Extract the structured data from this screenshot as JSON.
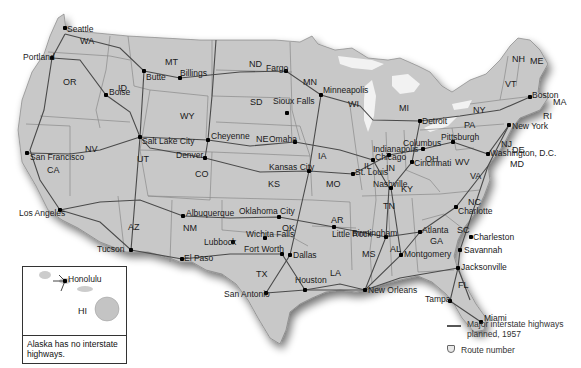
{
  "map": {
    "title": "Major interstate highways planned, 1957",
    "colors": {
      "land": "#c9c9c9",
      "state_border": "#8a8a8a",
      "highway": "#4a4a4a",
      "water": "#ffffff",
      "shadow": "#9a9a9a"
    },
    "states": [
      {
        "abbr": "WA",
        "x": 80,
        "y": 37
      },
      {
        "abbr": "OR",
        "x": 63,
        "y": 78
      },
      {
        "abbr": "ID",
        "x": 118,
        "y": 84
      },
      {
        "abbr": "MT",
        "x": 165,
        "y": 58
      },
      {
        "abbr": "WY",
        "x": 180,
        "y": 112
      },
      {
        "abbr": "ND",
        "x": 249,
        "y": 60
      },
      {
        "abbr": "SD",
        "x": 250,
        "y": 98
      },
      {
        "abbr": "MN",
        "x": 303,
        "y": 78
      },
      {
        "abbr": "WI",
        "x": 348,
        "y": 100
      },
      {
        "abbr": "MI",
        "x": 399,
        "y": 104
      },
      {
        "abbr": "NV",
        "x": 85,
        "y": 145
      },
      {
        "abbr": "CA",
        "x": 47,
        "y": 166
      },
      {
        "abbr": "UT",
        "x": 137,
        "y": 155
      },
      {
        "abbr": "CO",
        "x": 195,
        "y": 170
      },
      {
        "abbr": "NE",
        "x": 256,
        "y": 135
      },
      {
        "abbr": "KS",
        "x": 268,
        "y": 180
      },
      {
        "abbr": "IA",
        "x": 318,
        "y": 152
      },
      {
        "abbr": "MO",
        "x": 326,
        "y": 180
      },
      {
        "abbr": "IL",
        "x": 364,
        "y": 162
      },
      {
        "abbr": "IN",
        "x": 386,
        "y": 164
      },
      {
        "abbr": "OH",
        "x": 425,
        "y": 155
      },
      {
        "abbr": "KY",
        "x": 401,
        "y": 185
      },
      {
        "abbr": "TN",
        "x": 383,
        "y": 202
      },
      {
        "abbr": "WV",
        "x": 455,
        "y": 158
      },
      {
        "abbr": "VA",
        "x": 470,
        "y": 172
      },
      {
        "abbr": "NC",
        "x": 468,
        "y": 198
      },
      {
        "abbr": "SC",
        "x": 457,
        "y": 226
      },
      {
        "abbr": "GA",
        "x": 430,
        "y": 237
      },
      {
        "abbr": "AL",
        "x": 390,
        "y": 245
      },
      {
        "abbr": "MS",
        "x": 362,
        "y": 250
      },
      {
        "abbr": "AR",
        "x": 331,
        "y": 216
      },
      {
        "abbr": "LA",
        "x": 330,
        "y": 269
      },
      {
        "abbr": "OK",
        "x": 282,
        "y": 224
      },
      {
        "abbr": "TX",
        "x": 256,
        "y": 270
      },
      {
        "abbr": "NM",
        "x": 183,
        "y": 224
      },
      {
        "abbr": "AZ",
        "x": 128,
        "y": 223
      },
      {
        "abbr": "PA",
        "x": 464,
        "y": 121
      },
      {
        "abbr": "NY",
        "x": 473,
        "y": 106
      },
      {
        "abbr": "NJ",
        "x": 501,
        "y": 140
      },
      {
        "abbr": "DE",
        "x": 512,
        "y": 146
      },
      {
        "abbr": "MD",
        "x": 510,
        "y": 160
      },
      {
        "abbr": "VT",
        "x": 505,
        "y": 80
      },
      {
        "abbr": "NH",
        "x": 512,
        "y": 55
      },
      {
        "abbr": "ME",
        "x": 530,
        "y": 57
      },
      {
        "abbr": "MA",
        "x": 553,
        "y": 98
      },
      {
        "abbr": "RI",
        "x": 543,
        "y": 112
      },
      {
        "abbr": "FL",
        "x": 458,
        "y": 281
      }
    ],
    "cities": [
      {
        "name": "Seattle",
        "x": 65,
        "y": 28,
        "dx": 2,
        "dy": -3
      },
      {
        "name": "Portland",
        "x": 52,
        "y": 58,
        "dx": -29,
        "dy": -5
      },
      {
        "name": "Boise",
        "x": 106,
        "y": 95,
        "dx": 3,
        "dy": -7
      },
      {
        "name": "Butte",
        "x": 144,
        "y": 71,
        "dx": 2,
        "dy": 2
      },
      {
        "name": "Billings",
        "x": 180,
        "y": 78,
        "dx": 0,
        "dy": -9
      },
      {
        "name": "Fargo",
        "x": 286,
        "y": 71,
        "dx": -20,
        "dy": -7
      },
      {
        "name": "Minneapolis",
        "x": 321,
        "y": 95,
        "dx": 2,
        "dy": -9
      },
      {
        "name": "Sioux Falls",
        "x": 287,
        "y": 113,
        "dx": -14,
        "dy": -16
      },
      {
        "name": "Salt Lake City",
        "x": 140,
        "y": 137,
        "dx": 2,
        "dy": 0
      },
      {
        "name": "Cheyenne",
        "x": 208,
        "y": 140,
        "dx": 3,
        "dy": -8
      },
      {
        "name": "Denver",
        "x": 205,
        "y": 158,
        "dx": -29,
        "dy": -7
      },
      {
        "name": "Omaha",
        "x": 295,
        "y": 142,
        "dx": -26,
        "dy": -7
      },
      {
        "name": "Chicago",
        "x": 373,
        "y": 160,
        "dx": 2,
        "dy": -7
      },
      {
        "name": "Detroit",
        "x": 420,
        "y": 121,
        "dx": 2,
        "dy": -4
      },
      {
        "name": "Kansas City",
        "x": 309,
        "y": 171,
        "dx": -40,
        "dy": -8
      },
      {
        "name": "St. Louis",
        "x": 353,
        "y": 174,
        "dx": 2,
        "dy": -6
      },
      {
        "name": "San Francisco",
        "x": 27,
        "y": 153,
        "dx": 3,
        "dy": 0
      },
      {
        "name": "Indianapolis",
        "x": 389,
        "y": 155,
        "dx": -16,
        "dy": -10
      },
      {
        "name": "Columbus",
        "x": 423,
        "y": 149,
        "dx": -20,
        "dy": -10
      },
      {
        "name": "Cincinnati",
        "x": 412,
        "y": 162,
        "dx": 2,
        "dy": -3
      },
      {
        "name": "Pittsburgh",
        "x": 453,
        "y": 142,
        "dx": -12,
        "dy": -9
      },
      {
        "name": "New York",
        "x": 509,
        "y": 125,
        "dx": 3,
        "dy": -3
      },
      {
        "name": "Boston",
        "x": 530,
        "y": 97,
        "dx": 2,
        "dy": -6
      },
      {
        "name": "Washington, D.C.",
        "x": 488,
        "y": 154,
        "dx": 2,
        "dy": -5
      },
      {
        "name": "Los Angeles",
        "x": 60,
        "y": 210,
        "dx": -41,
        "dy": -1
      },
      {
        "name": "Albuquerque",
        "x": 183,
        "y": 216,
        "dx": 3,
        "dy": -7
      },
      {
        "name": "Oklahoma City",
        "x": 279,
        "y": 217,
        "dx": -40,
        "dy": -10
      },
      {
        "name": "Nashville",
        "x": 391,
        "y": 188,
        "dx": -18,
        "dy": -8
      },
      {
        "name": "Charlotte",
        "x": 456,
        "y": 207,
        "dx": 2,
        "dy": 0
      },
      {
        "name": "Tucson",
        "x": 131,
        "y": 250,
        "dx": -34,
        "dy": -5
      },
      {
        "name": "Lubbock",
        "x": 233,
        "y": 242,
        "dx": -29,
        "dy": -4
      },
      {
        "name": "Wichita Falls",
        "x": 265,
        "y": 238,
        "dx": -19,
        "dy": -8
      },
      {
        "name": "Little Rock",
        "x": 334,
        "y": 227,
        "dx": -2,
        "dy": 3
      },
      {
        "name": "Birmingham",
        "x": 386,
        "y": 237,
        "dx": -34,
        "dy": -8
      },
      {
        "name": "Atlanta",
        "x": 420,
        "y": 232,
        "dx": 2,
        "dy": -6
      },
      {
        "name": "Charleston",
        "x": 471,
        "y": 237,
        "dx": 2,
        "dy": -4
      },
      {
        "name": "Fort Worth",
        "x": 282,
        "y": 254,
        "dx": -38,
        "dy": -9
      },
      {
        "name": "Dallas",
        "x": 290,
        "y": 255,
        "dx": 3,
        "dy": -4
      },
      {
        "name": "El Paso",
        "x": 182,
        "y": 259,
        "dx": 2,
        "dy": -5
      },
      {
        "name": "Montgomery",
        "x": 401,
        "y": 255,
        "dx": 3,
        "dy": -5
      },
      {
        "name": "Savannah",
        "x": 460,
        "y": 250,
        "dx": 4,
        "dy": -4
      },
      {
        "name": "Jacksonville",
        "x": 458,
        "y": 268,
        "dx": 3,
        "dy": -5
      },
      {
        "name": "San Antonio",
        "x": 266,
        "y": 293,
        "dx": -42,
        "dy": -3
      },
      {
        "name": "Houston",
        "x": 305,
        "y": 290,
        "dx": -10,
        "dy": -14
      },
      {
        "name": "New Orleans",
        "x": 365,
        "y": 290,
        "dx": 3,
        "dy": -4
      },
      {
        "name": "Tampa",
        "x": 450,
        "y": 301,
        "dx": -25,
        "dy": -6
      },
      {
        "name": "Miami",
        "x": 481,
        "y": 322,
        "dx": 3,
        "dy": -8
      }
    ],
    "inset": {
      "state": "HI",
      "city": "Honolulu",
      "note": "Alaska has no interstate highways."
    },
    "legend": {
      "highway_label": "Major interstate highways planned, 1957",
      "route_label": "Route number",
      "highway_icon": "line-icon",
      "route_icon": "shield-icon"
    }
  }
}
